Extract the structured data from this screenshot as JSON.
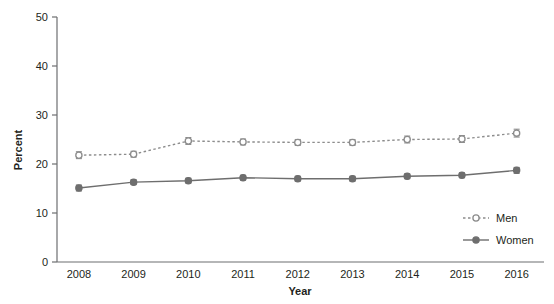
{
  "chart_data": {
    "type": "line",
    "title": "",
    "xlabel": "Year",
    "ylabel": "Percent",
    "categories": [
      "2008",
      "2009",
      "2010",
      "2011",
      "2012",
      "2013",
      "2014",
      "2015",
      "2016"
    ],
    "x": [
      2008,
      2009,
      2010,
      2011,
      2012,
      2013,
      2014,
      2015,
      2016
    ],
    "xlim": [
      2007.6,
      2016.5
    ],
    "ylim": [
      0,
      50
    ],
    "yticks": [
      0,
      10,
      20,
      30,
      40,
      50
    ],
    "ytick_labels": [
      "0",
      "10",
      "20",
      "30",
      "40",
      "50"
    ],
    "grid": false,
    "legend_position": "lower right",
    "error_bars": true,
    "series": [
      {
        "name": "Men",
        "values": [
          21.8,
          22.0,
          24.7,
          24.5,
          24.4,
          24.4,
          25.0,
          25.1,
          26.3
        ],
        "errors": [
          0.7,
          0.6,
          0.7,
          0.6,
          0.6,
          0.6,
          0.7,
          0.7,
          0.8
        ],
        "marker": "open-circle",
        "linestyle": "dashed",
        "color": "#8c8c8c"
      },
      {
        "name": "Women",
        "values": [
          15.1,
          16.3,
          16.6,
          17.2,
          17.0,
          17.0,
          17.5,
          17.7,
          18.7
        ],
        "errors": [
          0.6,
          0.5,
          0.5,
          0.5,
          0.5,
          0.5,
          0.5,
          0.5,
          0.6
        ],
        "marker": "filled-circle",
        "linestyle": "solid",
        "color": "#6e6e6e"
      }
    ]
  },
  "axes": {
    "y_title": "Percent",
    "x_title": "Year"
  },
  "legend": {
    "items": [
      {
        "label": "Men"
      },
      {
        "label": "Women"
      }
    ]
  },
  "colors": {
    "men": "#8c8c8c",
    "women": "#6e6e6e",
    "axis": "#6d6e71",
    "text": "#231f20"
  }
}
